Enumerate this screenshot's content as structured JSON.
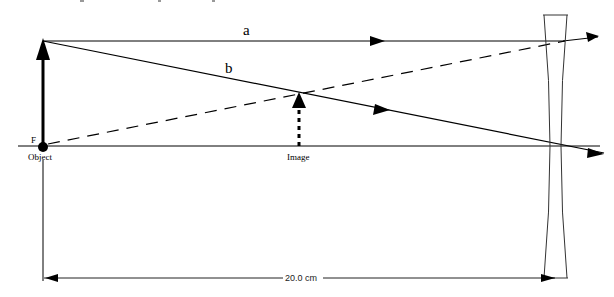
{
  "diagram": {
    "type": "ray-diagram",
    "lens": "diverging (concave) lens",
    "labels": {
      "focal_point": "F",
      "object": "Object",
      "image": "Image",
      "ray_a": "a",
      "ray_b": "b",
      "distance": "20.0 cm"
    },
    "colors": {
      "ink": "#000000",
      "lens": "#333333"
    }
  }
}
